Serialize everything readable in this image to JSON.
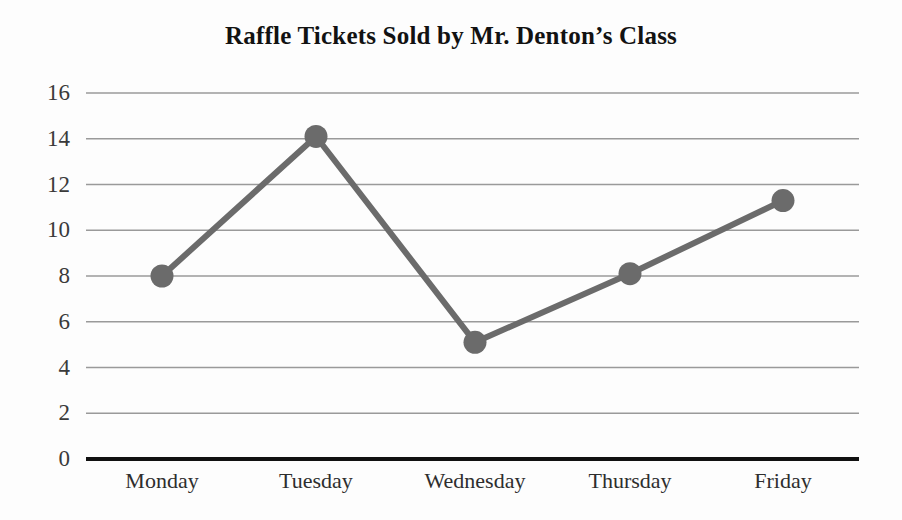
{
  "chart_data": {
    "type": "line",
    "title": "Raffle Tickets Sold by Mr. Denton’s Class",
    "xlabel": "",
    "ylabel": "",
    "categories": [
      "Monday",
      "Tuesday",
      "Wednesday",
      "Thursday",
      "Friday"
    ],
    "values": [
      8.0,
      14.1,
      5.1,
      8.1,
      11.3
    ],
    "ylim": [
      0,
      16
    ],
    "yticks": [
      0,
      2,
      4,
      6,
      8,
      10,
      12,
      14,
      16
    ],
    "ytick_labels": [
      "0",
      "2",
      "4",
      "6",
      "8",
      "10",
      "12",
      "14",
      "16"
    ],
    "grid": true,
    "grid_axis": "y",
    "legend": false,
    "series": [
      {
        "name": "Raffle tickets sold",
        "values": [
          8.0,
          14.1,
          5.1,
          8.1,
          11.3
        ],
        "line_color": "#6b6b6b",
        "marker_color": "#6b6b6b",
        "marker": "circle"
      }
    ],
    "colors": {
      "line": "#6b6b6b",
      "marker": "#6b6b6b",
      "grid": "#9a9a9a",
      "axis": "#111111",
      "title": "#121212",
      "tick_label": "#333333",
      "background": "#fdfdfd"
    }
  }
}
